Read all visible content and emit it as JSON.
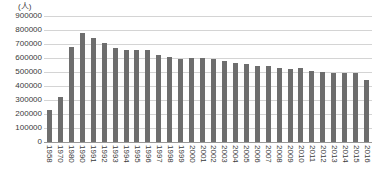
{
  "chart_data": {
    "type": "bar",
    "title": "",
    "subtitle": "",
    "xlabel": "",
    "ylabel": "(人)",
    "unit_label": "(人)",
    "ylim": [
      0,
      900000
    ],
    "ytick_step": 100000,
    "yticks": [
      "900000",
      "800000",
      "700000",
      "600000",
      "500000",
      "400000",
      "300000",
      "200000",
      "100000",
      "0"
    ],
    "grid": true,
    "legend": null,
    "legend_position": "none",
    "bar_color": "#6e6e6e",
    "gridline_color": "#d4d4d4",
    "axis_color": "#9a9a9a",
    "text_color": "#3a3a3a",
    "background_color": "#ffffff",
    "xtick_rotation": 90,
    "categories": [
      "1958",
      "1970",
      "1980",
      "1990",
      "1991",
      "1992",
      "1993",
      "1994",
      "1995",
      "1996",
      "1997",
      "1998",
      "1999",
      "2000",
      "2001",
      "2002",
      "2003",
      "2004",
      "2005",
      "2006",
      "2007",
      "2008",
      "2009",
      "2010",
      "2011",
      "2012",
      "2013",
      "2014",
      "2015",
      "2016"
    ],
    "values": [
      230000,
      325000,
      680000,
      780000,
      742000,
      707000,
      675000,
      660000,
      655000,
      655000,
      625000,
      605000,
      592000,
      600000,
      600000,
      595000,
      580000,
      565000,
      560000,
      545000,
      540000,
      530000,
      525000,
      530000,
      510000,
      500000,
      495000,
      490000,
      490000,
      440000
    ]
  }
}
